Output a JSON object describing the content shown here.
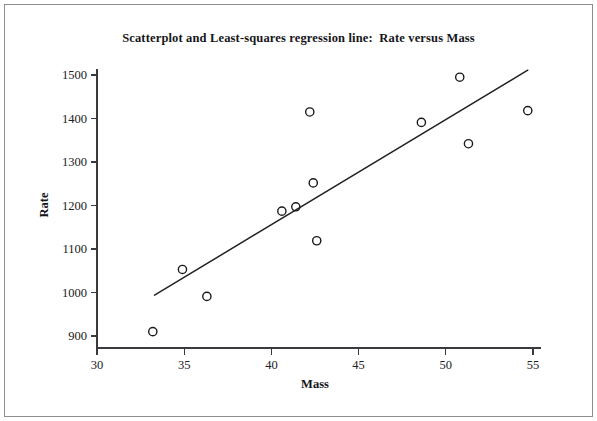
{
  "chart_data": {
    "type": "scatter",
    "title": "Scatterplot and Least-squares regression line:  Rate versus Mass",
    "xlabel": "Mass",
    "ylabel": "Rate",
    "xlim": [
      30,
      55
    ],
    "ylim": [
      900,
      1500
    ],
    "xticks": [
      30,
      35,
      40,
      45,
      50,
      55
    ],
    "yticks": [
      900,
      1000,
      1100,
      1200,
      1300,
      1400,
      1500
    ],
    "xtick_labels": [
      "30",
      "35",
      "40",
      "45",
      "50",
      "55"
    ],
    "ytick_labels": [
      "900",
      "1000",
      "1100",
      "1200",
      "1300",
      "1400",
      "1500"
    ],
    "grid": false,
    "legend": false,
    "marker": "open-circle",
    "points": [
      {
        "x": 33.2,
        "y": 910
      },
      {
        "x": 34.9,
        "y": 1053
      },
      {
        "x": 36.3,
        "y": 991
      },
      {
        "x": 40.6,
        "y": 1187
      },
      {
        "x": 41.4,
        "y": 1197
      },
      {
        "x": 42.2,
        "y": 1415
      },
      {
        "x": 42.4,
        "y": 1252
      },
      {
        "x": 42.6,
        "y": 1119
      },
      {
        "x": 48.6,
        "y": 1391
      },
      {
        "x": 50.8,
        "y": 1495
      },
      {
        "x": 51.3,
        "y": 1342
      },
      {
        "x": 54.7,
        "y": 1418
      }
    ],
    "regression_line": {
      "name": "Least-squares regression line",
      "x_start": 33.3,
      "y_start": 994,
      "x_end": 54.7,
      "y_end": 1511
    },
    "colors": {
      "marker_stroke": "#1a1a1d",
      "line": "#222226",
      "axis": "#3a3a3e",
      "text": "#16161a",
      "background": "#ffffff",
      "frame": "#8d8d8d"
    }
  }
}
